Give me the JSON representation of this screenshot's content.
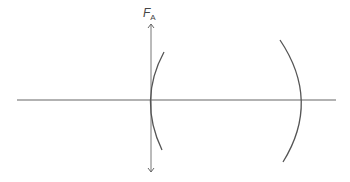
{
  "diagram": {
    "type": "optics-lens-diagram",
    "label": {
      "main": "F",
      "subscript": "A"
    },
    "elements": [
      {
        "kind": "optical-axis",
        "description": "horizontal principal axis"
      },
      {
        "kind": "lens-surface",
        "description": "left concave arc surface"
      },
      {
        "kind": "lens-surface",
        "description": "right convex arc surface"
      },
      {
        "kind": "double-arrow",
        "description": "vertical arrow through axis labeled F_A"
      }
    ],
    "colors": {
      "stroke": "#666666",
      "text": "#444444"
    }
  }
}
